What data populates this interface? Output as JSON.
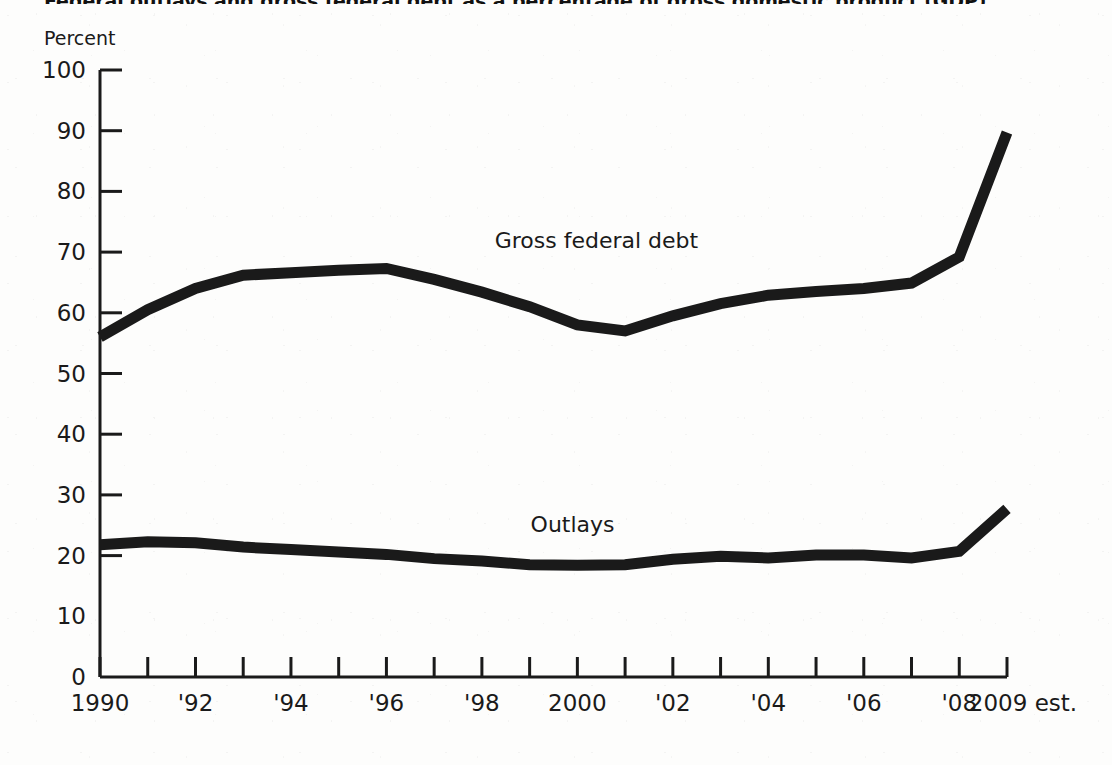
{
  "chart_data": {
    "type": "line",
    "title": "Federal outlays and gross federal debt as a percentage of gross domestic product (GDP)",
    "ylabel": "Percent",
    "xlabel": "",
    "ylim": [
      0,
      100
    ],
    "ytick_values": [
      0,
      10,
      20,
      30,
      40,
      50,
      60,
      70,
      80,
      90,
      100
    ],
    "ytick_labels": [
      "0",
      "10",
      "20",
      "30",
      "40",
      "50",
      "60",
      "70",
      "80",
      "90",
      "100"
    ],
    "xlim": [
      1990,
      2009
    ],
    "grid": false,
    "legend_position": "inline-annotation",
    "x": [
      1990,
      1991,
      1992,
      1993,
      1994,
      1995,
      1996,
      1997,
      1998,
      1999,
      2000,
      2001,
      2002,
      2003,
      2004,
      2005,
      2006,
      2007,
      2008,
      2009
    ],
    "xtick_values": [
      1990,
      1992,
      1994,
      1996,
      1998,
      2000,
      2002,
      2004,
      2006,
      2008,
      2009
    ],
    "xtick_labels": [
      "1990",
      "'92",
      "'94",
      "'96",
      "'98",
      "2000",
      "'02",
      "'04",
      "'06",
      "'08",
      "2009 est."
    ],
    "series": [
      {
        "name": "Gross federal debt",
        "color": "#1a1a1a",
        "label_x": 2000.4,
        "label_y": 72.0,
        "values": [
          56.0,
          60.5,
          64.0,
          66.2,
          66.6,
          67.0,
          67.3,
          65.5,
          63.4,
          61.0,
          58.0,
          57.0,
          59.5,
          61.5,
          62.9,
          63.5,
          64.0,
          64.9,
          69.2,
          89.7
        ]
      },
      {
        "name": "Outlays",
        "color": "#1a1a1a",
        "label_x": 1999.9,
        "label_y": 25.2,
        "values": [
          21.8,
          22.3,
          22.1,
          21.4,
          21.0,
          20.6,
          20.2,
          19.5,
          19.1,
          18.5,
          18.4,
          18.5,
          19.4,
          19.9,
          19.6,
          20.1,
          20.1,
          19.6,
          20.7,
          27.7
        ]
      }
    ],
    "axis": {
      "x_pixel_start": 100,
      "x_pixel_end": 1007,
      "y_pixel_zero": 677,
      "y_pixel_top": 70,
      "line_width": 11,
      "axis_color": "#1a1a1a"
    }
  }
}
